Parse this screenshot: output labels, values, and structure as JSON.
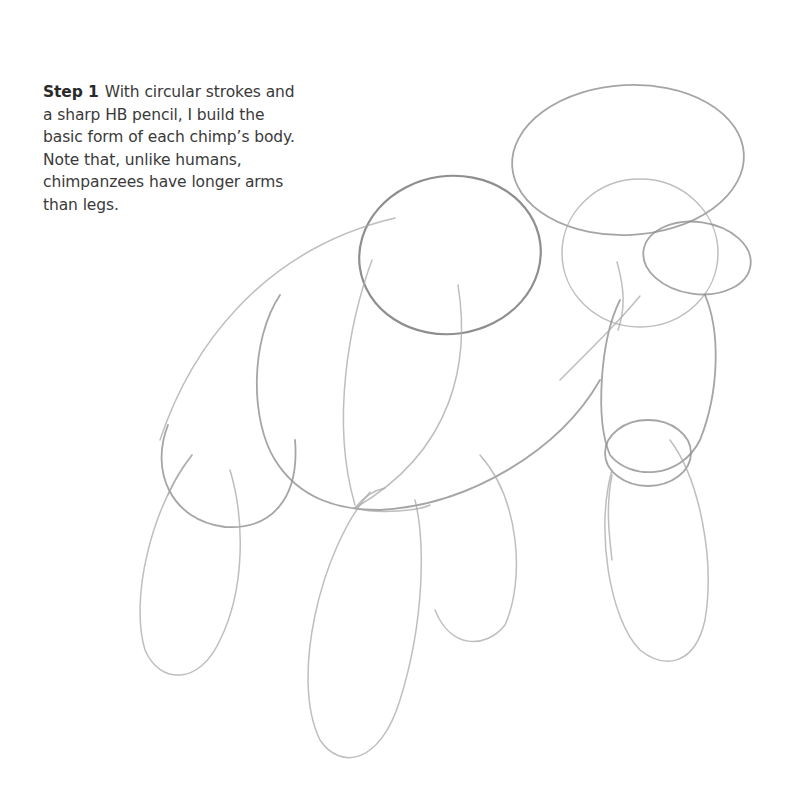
{
  "caption": {
    "step_label": "Step 1",
    "text": "With circular strokes and a sharp HB pencil, I build the basic form of each chimp’s body. Note that, unlike humans, chimpanzees have longer arms than legs."
  },
  "illustration": {
    "description": "Pencil sketch of basic chimpanzee body forms built from overlapping ellipses",
    "stroke_color": "#8a8a8a",
    "background": "#ffffff"
  }
}
